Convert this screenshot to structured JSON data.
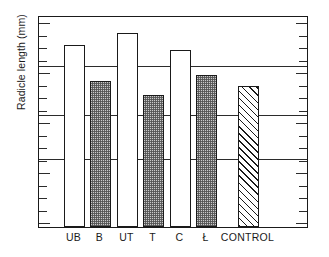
{
  "chart_data": {
    "type": "bar",
    "title": "",
    "xlabel": "",
    "ylabel": "Radicle length (mm)",
    "categories": [
      "UB",
      "B",
      "UT",
      "T",
      "C",
      "Ł",
      "CONTROL"
    ],
    "values": [
      85.8,
      68.9,
      91.5,
      62.3,
      83.5,
      71.7,
      66.5
    ],
    "ylim": [
      0,
      100
    ],
    "grid": true,
    "gridlines_y": [
      77,
      54,
      33
    ],
    "legend": "none",
    "series": [
      {
        "name": "Radicle length",
        "values": [
          85.8,
          68.9,
          91.5,
          62.3,
          83.5,
          71.7,
          66.5
        ],
        "fills": [
          "open",
          "stipple",
          "open",
          "stipple",
          "open",
          "stipple",
          "hatch"
        ]
      }
    ],
    "axis_ticks_left": 17,
    "axis_ticks_right": 17
  },
  "axes": {
    "y_title": "Radicle length (mm)"
  },
  "bars": [
    {
      "label": "UB",
      "value": 85.8,
      "fill": "open",
      "x": 25,
      "width": 21,
      "top": 30
    },
    {
      "label": "B",
      "value": 68.9,
      "fill": "stipple",
      "x": 51,
      "width": 21,
      "top": 66
    },
    {
      "label": "UT",
      "value": 91.5,
      "fill": "open",
      "x": 78,
      "width": 21,
      "top": 18
    },
    {
      "label": "T",
      "value": 62.3,
      "fill": "stipple",
      "x": 104,
      "width": 21,
      "top": 80
    },
    {
      "label": "C",
      "value": 83.5,
      "fill": "open",
      "x": 131,
      "width": 21,
      "top": 35
    },
    {
      "label": "Ł",
      "value": 71.7,
      "fill": "stipple",
      "x": 157,
      "width": 21,
      "top": 60
    },
    {
      "label": "CONTROL",
      "value": 66.5,
      "fill": "hatch",
      "x": 199,
      "width": 21,
      "top": 71
    }
  ],
  "style": {
    "frame_color": "#1a1a1a",
    "grid_color": "#2b2b2b",
    "bar_edge_color": "#1a1a1a",
    "stipple_color": "#c9c9c9",
    "background": "#ffffff"
  }
}
